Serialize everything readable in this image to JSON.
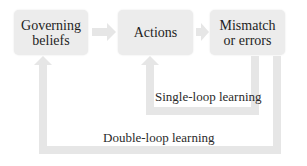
{
  "diagram": {
    "nodes": [
      {
        "id": "governing-beliefs",
        "label_line1": "Governing",
        "label_line2": "beliefs"
      },
      {
        "id": "actions",
        "label_line1": "Actions",
        "label_line2": ""
      },
      {
        "id": "mismatch",
        "label_line1": "Mismatch",
        "label_line2": "or errors"
      }
    ],
    "loops": {
      "single": "Single-loop learning",
      "double": "Double-loop learning"
    },
    "colors": {
      "box_fill": "#ececec",
      "arrow_fill": "#e6e6e6",
      "text": "#1e1e1e"
    }
  }
}
